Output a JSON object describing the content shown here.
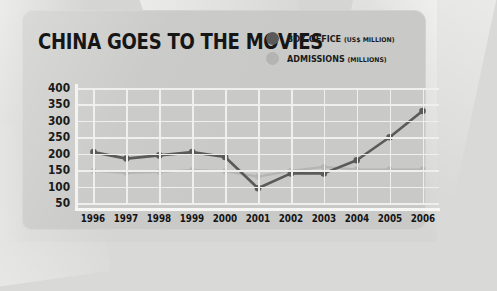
{
  "title": "CHINA GOES TO THE MOVIES",
  "legend": [
    {
      "label": "BOX OFFICE",
      "unit": "(US$ MILLION)",
      "color": "#5a5a5a",
      "key": "box_office"
    },
    {
      "label": "ADMISSIONS",
      "unit": "(MILLIONS)",
      "color": "#b4b4b2",
      "key": "admissions"
    }
  ],
  "colors": {
    "box_office": "#5a5a5a",
    "admissions": "#b4b4b2",
    "grid": "#efefee",
    "panel": "#c9c9c7",
    "page": "#d5d5d3",
    "text": "#161616"
  },
  "chart_data": {
    "type": "line",
    "title": "CHINA GOES TO THE MOVIES",
    "xlabel": "",
    "ylabel": "",
    "ylim": [
      50,
      400
    ],
    "yticks": [
      50,
      100,
      150,
      200,
      250,
      300,
      350,
      400
    ],
    "grid": true,
    "legend_position": "top-right",
    "categories": [
      "1996",
      "1997",
      "1998",
      "1999",
      "2000",
      "2001",
      "2002",
      "2003",
      "2004",
      "2005",
      "2006"
    ],
    "series": [
      {
        "name": "BOX OFFICE (US$ MILLION)",
        "color": "#5a5a5a",
        "values": [
          205,
          185,
          195,
          205,
          190,
          95,
          140,
          140,
          180,
          250,
          330
        ]
      },
      {
        "name": "ADMISSIONS (MILLIONS)",
        "color": "#b4b4b2",
        "values": [
          148,
          142,
          145,
          150,
          147,
          130,
          148,
          160,
          152,
          152,
          152
        ]
      }
    ]
  }
}
